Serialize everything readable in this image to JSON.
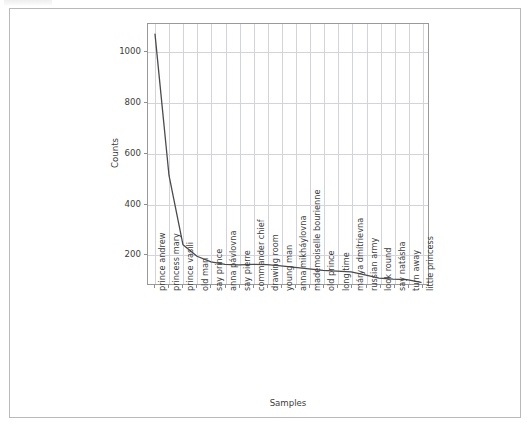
{
  "figure": {
    "background": "#ffffff",
    "axes_border_color": "#9a9a9a",
    "grid_color": "#d3d3de",
    "line_color": "#4a4a4a",
    "tick_color": "#8d8d8d",
    "text_color": "#3c3c3c"
  },
  "chart_data": {
    "type": "line",
    "title": "",
    "xlabel": "Samples",
    "ylabel": "Counts",
    "ylim": [
      80,
      1110
    ],
    "yticks": [
      200,
      400,
      600,
      800,
      1000
    ],
    "ytick_labels": [
      "200",
      "400",
      "600",
      "800",
      "1000"
    ],
    "grid": true,
    "legend": null,
    "categories": [
      "prince andrew",
      "princess mary",
      "prince vasili",
      "old man",
      "say prince",
      "anna pávlovna",
      "say pierre",
      "commander chief",
      "drawing room",
      "young man",
      "anna mikháylovna",
      "mademoiselle bourienne",
      "old prince",
      "long time",
      "márya dmítrievna",
      "russian army",
      "look round",
      "say natásha",
      "turn away",
      "little princess"
    ],
    "values": [
      1070,
      510,
      235,
      190,
      168,
      158,
      156,
      158,
      157,
      152,
      146,
      140,
      134,
      131,
      128,
      116,
      103,
      99,
      97,
      86
    ],
    "series": [
      {
        "name": "Counts",
        "color": "#4a4a4a",
        "values": [
          1070,
          510,
          235,
          190,
          168,
          158,
          156,
          158,
          157,
          152,
          146,
          140,
          134,
          131,
          128,
          116,
          103,
          99,
          97,
          86
        ]
      }
    ]
  }
}
